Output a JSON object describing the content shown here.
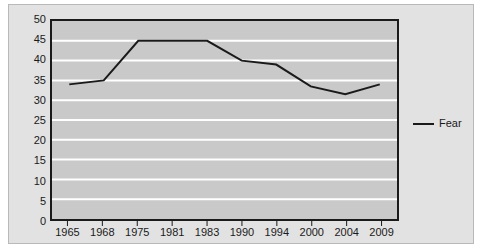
{
  "chart_data": {
    "type": "line",
    "title": "",
    "subtitle": "",
    "xlabel": "",
    "ylabel": "",
    "categories": [
      "1965",
      "1968",
      "1975",
      "1981",
      "1983",
      "1990",
      "1994",
      "2000",
      "2004",
      "2009"
    ],
    "series": [
      {
        "name": "Fear",
        "values": [
          34,
          35,
          45,
          45,
          45,
          40,
          39,
          33.5,
          31.5,
          34
        ],
        "color": "#1a1a1a"
      }
    ],
    "ylim": [
      0,
      50
    ],
    "y_ticks": [
      0,
      5,
      10,
      15,
      20,
      25,
      30,
      35,
      40,
      45,
      50
    ],
    "y_tick_labels": [
      "0",
      "5",
      "10",
      "15",
      "20",
      "25",
      "30",
      "35",
      "40",
      "45",
      "50"
    ],
    "grid": true,
    "grid_color": "#ffffff",
    "gridlines": "horizontal",
    "legend_position": "right",
    "plot_background": "#c9c9c9",
    "chart_background": "#e2e2e2",
    "axis_color": "#1a1a1a"
  },
  "legend": {
    "entries": [
      {
        "label": "Fear"
      }
    ]
  }
}
